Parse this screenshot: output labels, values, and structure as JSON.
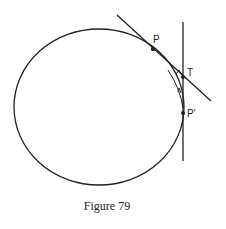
{
  "figure": {
    "caption": "Figure 79",
    "labels": {
      "P": "P",
      "T": "T",
      "P_prime": "P'"
    },
    "colors": {
      "stroke": "#222222",
      "background": "#ffffff"
    }
  }
}
